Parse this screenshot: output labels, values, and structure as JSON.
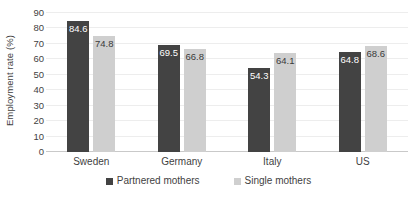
{
  "chart_data": {
    "type": "bar",
    "title": "",
    "xlabel": "",
    "ylabel": "Employment rate (%)",
    "ylim": [
      0,
      90
    ],
    "yticks": [
      0,
      10,
      20,
      30,
      40,
      50,
      60,
      70,
      80,
      90
    ],
    "grid": true,
    "legend_position": "bottom",
    "categories": [
      "Sweden",
      "Germany",
      "Italy",
      "US"
    ],
    "series": [
      {
        "name": "Partnered mothers",
        "color": "#434343",
        "values": [
          84.6,
          69.5,
          54.3,
          64.8
        ],
        "labels": [
          "84.6",
          "69.5",
          "54.3",
          "64.8"
        ]
      },
      {
        "name": "Single mothers",
        "color": "#cfcfcf",
        "values": [
          74.8,
          66.8,
          64.1,
          68.6
        ],
        "labels": [
          "74.8",
          "66.8",
          "64.1",
          "68.6"
        ]
      }
    ]
  }
}
